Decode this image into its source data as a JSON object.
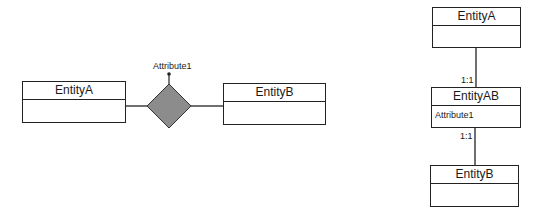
{
  "left_diagram": {
    "entity_a": {
      "name": "EntityA",
      "attributes": []
    },
    "entity_b": {
      "name": "EntityB",
      "attributes": []
    },
    "relationship": {
      "shape": "diamond",
      "fill": "#8c8c8c",
      "attribute": "Attribute1"
    }
  },
  "right_diagram": {
    "entity_a": {
      "name": "EntityA",
      "attributes": []
    },
    "entity_ab": {
      "name": "EntityAB",
      "attributes": [
        "Attribute1"
      ]
    },
    "entity_b": {
      "name": "EntityB",
      "attributes": []
    },
    "cardinality_top": "1:1",
    "cardinality_bottom": "1:1"
  },
  "colors": {
    "line": "#222222",
    "diamond_fill": "#8c8c8c",
    "background": "#ffffff"
  }
}
